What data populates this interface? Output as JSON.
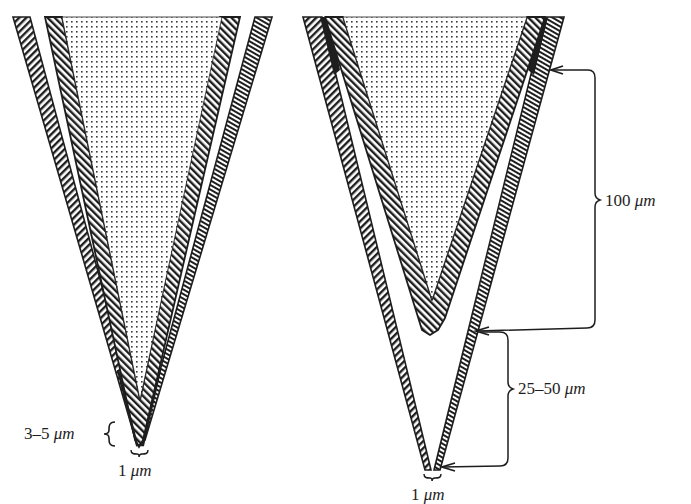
{
  "figure": {
    "colors": {
      "ink": "#1e1e1e",
      "background": "#ffffff",
      "stipple": "#3a3a3a"
    },
    "left_probe": {
      "name": "Left probe",
      "labels": {
        "length": {
          "value": "3–5",
          "unit": "μm"
        },
        "tip_width": {
          "value": "1",
          "unit": "μm"
        }
      }
    },
    "right_probe": {
      "name": "Right probe",
      "labels": {
        "recess_upper": {
          "value": "100",
          "unit": "μm"
        },
        "recess_lower": {
          "value": "25–50",
          "unit": "μm"
        },
        "tip_width": {
          "value": "1",
          "unit": "μm"
        }
      }
    }
  }
}
